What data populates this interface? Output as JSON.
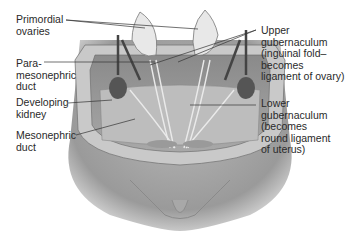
{
  "diagram": {
    "type": "anatomical illustration",
    "labels_left": [
      {
        "id": "primordial-ovaries",
        "text": "Primordial\novaries"
      },
      {
        "id": "paramesonephric-duct",
        "text": "Para-\nmesonephric\nduct"
      },
      {
        "id": "developing-kidney",
        "text": "Developing\nkidney"
      },
      {
        "id": "mesonephric-duct",
        "text": "Mesonephric\nduct"
      }
    ],
    "labels_right": [
      {
        "id": "upper-gubernaculum",
        "text": "Upper\ngubernaculum\n(inguinal fold–\nbecomes\nligament of ovary)"
      },
      {
        "id": "lower-gubernaculum",
        "text": "Lower\ngubernaculum\n(becomes\nround ligament\nof uterus)"
      }
    ]
  }
}
